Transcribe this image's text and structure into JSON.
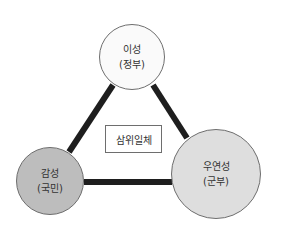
{
  "diagram": {
    "type": "triangle-relationship",
    "center_label": "삼위일체",
    "nodes": [
      {
        "id": "top",
        "label": "이성",
        "sublabel": "(정부)",
        "fill": "#fafafa"
      },
      {
        "id": "left",
        "label": "감성",
        "sublabel": "(국민)",
        "fill": "#bdbdbd"
      },
      {
        "id": "right",
        "label": "우연성",
        "sublabel": "(군부)",
        "fill": "#dedede"
      }
    ],
    "edges": [
      {
        "from": "top",
        "to": "left"
      },
      {
        "from": "top",
        "to": "right"
      },
      {
        "from": "left",
        "to": "right"
      }
    ],
    "colors": {
      "edge": "#1e1e1e",
      "border": "#6e6e6e",
      "text": "#333333"
    }
  }
}
